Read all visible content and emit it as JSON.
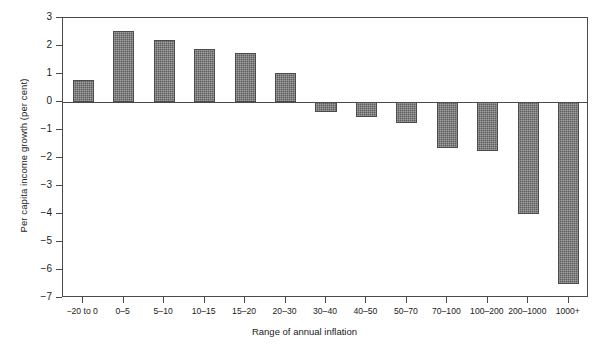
{
  "chart_data": {
    "type": "bar",
    "title": "",
    "xlabel": "Range of annual inflation",
    "ylabel": "Per capita income growth (per cent)",
    "categories": [
      "−20 to 0",
      "0–5",
      "5–10",
      "10–15",
      "15–20",
      "20–30",
      "30–40",
      "40–50",
      "50–70",
      "70–100",
      "100–200",
      "200–1000",
      "1000+"
    ],
    "values": [
      0.8,
      2.55,
      2.2,
      1.9,
      1.75,
      1.05,
      -0.35,
      -0.55,
      -0.75,
      -1.65,
      -1.75,
      -4.0,
      -6.5
    ],
    "ylim": [
      -7,
      3
    ],
    "ytick_labels": [
      "3",
      "2",
      "1",
      "0",
      "−1",
      "−2",
      "−3",
      "−4",
      "−5",
      "−6",
      "−7"
    ],
    "ytick_values": [
      3,
      2,
      1,
      0,
      -1,
      -2,
      -3,
      -4,
      -5,
      -6,
      -7
    ],
    "grid": false,
    "legend": "none",
    "bar_color": "#5d5d5d",
    "axis_color": "#4a4a4a"
  }
}
